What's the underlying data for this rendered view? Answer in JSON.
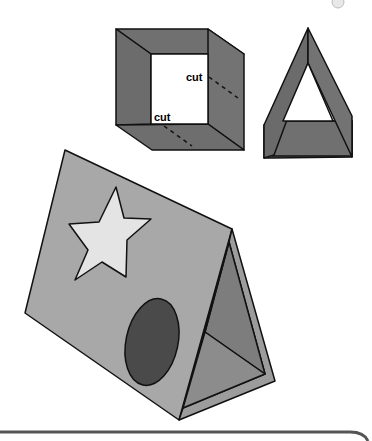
{
  "figure": {
    "labels": {
      "cut_top": "cut",
      "cut_bottom": "cut"
    },
    "colors": {
      "dark_gray": "#6f6f6f",
      "mid_gray": "#8a8a8a",
      "light_gray": "#a9a9a9",
      "star_fill": "#e4e4e4",
      "oval_fill": "#4a4a4a",
      "outline": "#111111",
      "background": "#ffffff"
    },
    "parts": [
      "open-box",
      "folded-triangle-frame",
      "finished-tent",
      "star-decoration",
      "oval-door",
      "bottom-panel-border"
    ]
  }
}
